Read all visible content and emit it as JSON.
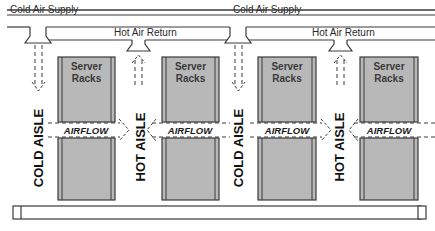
{
  "diagram": {
    "type": "data-center hot/cold aisle airflow",
    "ducts": {
      "cold_supply_labels": [
        "Cold Air Supply",
        "Cold Air Supply"
      ],
      "hot_return_labels": [
        "Hot Air Return",
        "Hot Air Return"
      ]
    },
    "racks": [
      {
        "label_line1": "Server",
        "label_line2": "Racks"
      },
      {
        "label_line1": "Server",
        "label_line2": "Racks"
      },
      {
        "label_line1": "Server",
        "label_line2": "Racks"
      },
      {
        "label_line1": "Server",
        "label_line2": "Racks"
      }
    ],
    "aisles": [
      {
        "label": "COLD AISLE",
        "kind": "cold"
      },
      {
        "label": "HOT AISLE",
        "kind": "hot"
      },
      {
        "label": "COLD AISLE",
        "kind": "cold"
      },
      {
        "label": "HOT AISLE",
        "kind": "hot"
      }
    ],
    "airflow_labels": [
      "AIRFLOW",
      "AIRFLOW",
      "AIRFLOW",
      "AIRFLOW"
    ],
    "colors": {
      "line": "#3a3a3a",
      "rack_fill": "#b8b8b8",
      "background": "#ffffff",
      "text": "#2a2a2a"
    }
  }
}
